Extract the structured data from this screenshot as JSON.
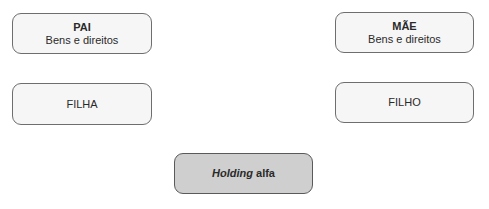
{
  "nodes": {
    "pai": {
      "title": "PAI",
      "subtitle": "Bens e direitos"
    },
    "mae": {
      "title": "MÃE",
      "subtitle": "Bens e direitos"
    },
    "filha": {
      "label": "FILHA"
    },
    "filho": {
      "label": "FILHO"
    },
    "holding": {
      "label_italic": "Holding",
      "label_rest": " alfa"
    }
  },
  "colors": {
    "box_fill": "#f6f6f6",
    "holding_fill": "#cfcfcf",
    "border": "#6e6e6e"
  }
}
